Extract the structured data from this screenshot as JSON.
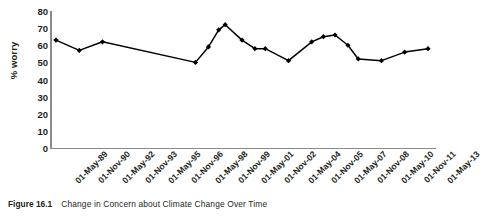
{
  "figure": {
    "number": "Figure 16.1",
    "caption": "Change in Concern about Climate Change Over Time"
  },
  "axes": {
    "ylabel": "% worry",
    "xlabel": ""
  },
  "chart_data": {
    "type": "line",
    "title": "Change in Concern about Climate Change Over Time",
    "xlabel": "",
    "ylabel": "% worry",
    "ylim": [
      0,
      80
    ],
    "ytick_labels": [
      "80",
      "70",
      "60",
      "50",
      "40",
      "30",
      "20",
      "10",
      "0"
    ],
    "ytick_values": [
      80,
      70,
      60,
      50,
      40,
      30,
      20,
      10,
      0
    ],
    "xtick_labels": [
      "01-May-89",
      "01-Nov-90",
      "01-May-92",
      "01-Nov-93",
      "01-May-95",
      "01-Nov-96",
      "01-May-98",
      "01-Nov-99",
      "01-May-01",
      "01-Nov-02",
      "01-May-04",
      "01-Nov-05",
      "01-May-07",
      "01-Nov-08",
      "01-May-10",
      "01-Nov-11",
      "01-May-13"
    ],
    "grid": false,
    "legend": false,
    "marker": "diamond",
    "line_color": "#000000",
    "marker_color": "#000000",
    "series": [
      {
        "name": "% worry",
        "points": [
          {
            "x": "01-May-89",
            "y": 63
          },
          {
            "x": "01-Nov-90",
            "y": 57
          },
          {
            "x": "01-May-92",
            "y": 62
          },
          {
            "x": "01-May-98",
            "y": 50
          },
          {
            "x": "01-Mar-99",
            "y": 59
          },
          {
            "x": "01-Nov-99",
            "y": 69
          },
          {
            "x": "01-Apr-00",
            "y": 72
          },
          {
            "x": "01-May-01",
            "y": 63
          },
          {
            "x": "01-Mar-02",
            "y": 58
          },
          {
            "x": "01-Nov-02",
            "y": 58
          },
          {
            "x": "01-May-04",
            "y": 51
          },
          {
            "x": "01-Nov-05",
            "y": 62
          },
          {
            "x": "01-Aug-06",
            "y": 65
          },
          {
            "x": "01-May-07",
            "y": 66
          },
          {
            "x": "01-Mar-08",
            "y": 60
          },
          {
            "x": "01-Nov-08",
            "y": 52
          },
          {
            "x": "01-May-10",
            "y": 51
          },
          {
            "x": "01-Nov-11",
            "y": 56
          },
          {
            "x": "01-May-13",
            "y": 58
          }
        ]
      }
    ]
  }
}
